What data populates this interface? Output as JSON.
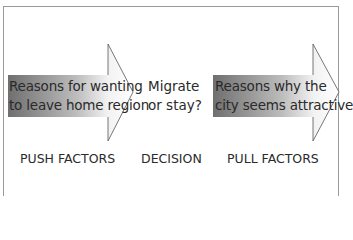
{
  "diagram": {
    "push_arrow": {
      "line1": "Reasons for wanting",
      "line2": "to leave home region",
      "gradient_start": "#7a7a7a",
      "gradient_end": "#ffffff"
    },
    "decision": {
      "line1": "Migrate",
      "line2": "or stay?"
    },
    "pull_arrow": {
      "line1": "Reasons why the",
      "line2": "city seems attractive",
      "gradient_start": "#7a7a7a",
      "gradient_end": "#ffffff"
    },
    "labels": {
      "push": "PUSH FACTORS",
      "decision": "DECISION",
      "pull": "PULL FACTORS"
    },
    "colors": {
      "frame": "#9a9a9a",
      "outline": "#555555",
      "text": "#2a2a2a"
    }
  }
}
